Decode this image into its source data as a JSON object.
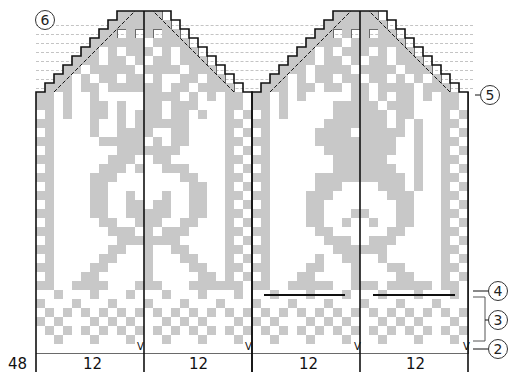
{
  "chart": {
    "cell_size": 9,
    "origin_x": 36,
    "top_y": 11,
    "rows": 38,
    "cols_per_section": 12,
    "colors": {
      "contrast": "#c8c8c8",
      "main": "#ffffff",
      "grid": "#6a6a6a",
      "outline": "#111111"
    },
    "stitch_count_label": "48",
    "section_labels": [
      "12",
      "12",
      "12",
      "12"
    ],
    "slip_marker": "V",
    "callouts": [
      {
        "id": "6",
        "label": "6"
      },
      {
        "id": "5",
        "label": "5"
      },
      {
        "id": "4",
        "label": "4"
      },
      {
        "id": "3",
        "label": "3"
      },
      {
        "id": "2",
        "label": "2"
      }
    ],
    "mittens": [
      {
        "name": "left-mitten",
        "x": 36,
        "rows": [
          "000000000GGGGG0000000000",
          "00000000GGGGGGG000000000",
          "0000000GG0G0G0GG00000000",
          "000000GGGGGG.GGGG0000000",
          "00000GG.G.GGG.G.GG000000",
          "0000GGG.GG.G.GG.GGG00000",
          "000GG.GGGGG.GGGG.GGG0000",
          "00GG.G.GG.GG.G..GG.GG000",
          "0GGG.GG.GGGGGG.GG.GGGG00",
          "GG.G..G.....GGGG.G.G.GG.",
          "GG.G..GG.G..GG.GGG...GG.",
          ".G.G..GG.G.GGG.GG.G..G.G",
          "GG....G..G.GGGGGG....GG.",
          ".G....G..GGGG..GG....G.G",
          "GG.....GGGGG.G.GG....GG.",
          ".G.......GGGGGGG.....G.G",
          "GG......GGG..GG......GG.",
          ".G.....GGG.G..GGG....G.G",
          "GG....GGG.......GG...GG.",
          ".G....GG.........GG..G.G",
          "GG....GG..G...G..GG..GG.",
          ".G....GG..GG.GG..GG..G.G",
          "GG....GG..GGGGG..GG..GG.",
          ".G.....GG..GGG..GG...G.G",
          "GG......GGG.G.GGG....GG.",
          ".G.......GGGGGGG.....G.G",
          "GG......GG..G..GG....GG.",
          ".G.....GG...G...GG...G.G",
          "GG....GG....G....GG..GG.",
          ".G...GG.....G.....GG.G.G",
          "GG..GGGG...GGG...GGGGGG.",
          "..G...G...G...G...G...G.",
          "G...G...G...G...G...G...",
          ".G.G.G.G.G.G.G.G.G.G.G.G",
          "G.G...G.G.G...G.G.G...G.",
          ".G.G.G.G.G.G.G.G.G.G.G.G",
          "..G...G...G...G...G...G.",
          "........................"
        ]
      },
      {
        "name": "right-mitten",
        "x": 252,
        "rows": [
          "000000000GGGGG0000000000",
          "00000000GGGGGGG000000000",
          "0000000GG0G0G0GG00000000",
          "000000GGGG.GGGGGG0000000",
          "00000GG.G.GGG.G.GG000000",
          "0000GGG.GG.G.GG.GGG00000",
          "000GGG.GGGG.GGGG.GGG0000",
          "00GG.G.GG.GG.GG.G.G.G000",
          "0GGG.GG.GG.GG.GGGG.GGG00",
          "GG.G.G.....GG.G.GG.G.GG.",
          "GG.G.....GGGGG.GGG...GG.",
          ".G.G.....GGGGGG.GG...G.G",
          "GG......GGGGGGG.G.G..GG.",
          ".G.....GGGG.GGGGG.G..G.G",
          "GG.....GGGGGGGGG..G..GG.",
          ".G......GGGGGGGG..G..G.G",
          "GG.......GGGGGG...G..GG.",
          ".G.......GGGGGGG..G..G.G",
          "GG.....GGGGGGGGGG.G..GG.",
          ".G.....GGG....GGG.G..G.G",
          "GG....GGG......GGG...GG.",
          ".G....GG........GG...G.G",
          "GG....GG...GG...GG...GG.",
          ".G....GG..G..G..GG...G.G",
          "GG.....GG......GG....GG.",
          ".G......GGG..GGG.....G.G",
          "GG.......GGGGGG......GG.",
          ".G.....G..GG..G......G.G",
          "GG....GG...G...GG....GG.",
          ".G...GG....G....GG...G.G",
          "GG..GGGGG..GGG.GGGGG.GG.",
          "..G...G...G...G...G...G.",
          "G...G...G...G...G...G...",
          ".G.G.G.G.G.G.G.G.G.G.G.G",
          "G.G...G.G.G...G.G.G...G.",
          ".G.G.G.G.G.G.G.G.G.G.G.G",
          "..G...G...G...G...G...G.",
          "........................"
        ]
      }
    ]
  }
}
